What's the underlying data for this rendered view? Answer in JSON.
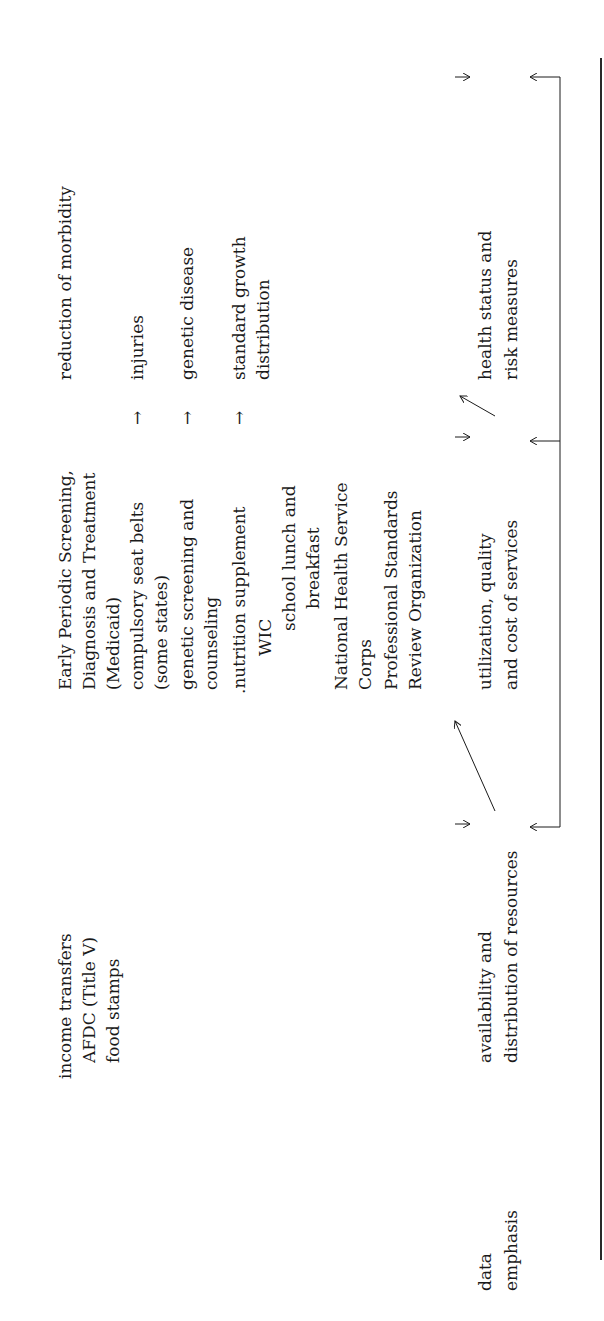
{
  "table": {
    "row_label": [
      "data",
      "emphasis"
    ],
    "programs_col1": {
      "heading": "income transfers",
      "items": [
        "AFDC (Title V)",
        "food stamps"
      ]
    },
    "programs_col2": {
      "items": [
        "Early Periodic Screening,",
        "Diagnosis and Treatment",
        "(Medicaid)",
        "compulsory seat belts",
        "(some states)",
        "genetic screening and",
        "counseling",
        ".nutrition supplement",
        "WIC",
        "school lunch and",
        "breakfast",
        "National Health Service",
        "Corps",
        "Professional Standards",
        "Review Organization"
      ]
    },
    "outcomes_col": {
      "heading": "reduction of morbidity",
      "items": [
        "injuries",
        "genetic disease",
        "standard growth",
        "distribution"
      ]
    },
    "arrows": {
      "seat_belts_to": "→",
      "genetic_to": "→",
      "nutrition_to": "→"
    },
    "data_emphasis": {
      "stage1": [
        "availability and",
        "distribution of resources"
      ],
      "stage2": [
        "utilization, quality",
        "and cost of services"
      ],
      "stage3": [
        "health status and",
        "risk measures"
      ]
    }
  }
}
